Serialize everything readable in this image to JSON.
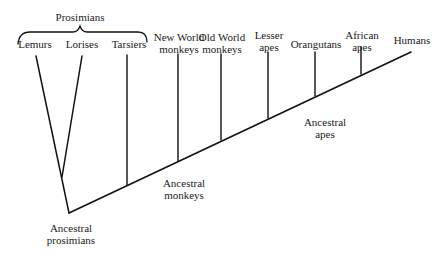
{
  "group_label": "Prosimians",
  "taxa": [
    {
      "id": "lemurs",
      "line1": "Lemurs",
      "line2": ""
    },
    {
      "id": "lorises",
      "line1": "Lorises",
      "line2": ""
    },
    {
      "id": "tarsiers",
      "line1": "Tarsiers",
      "line2": ""
    },
    {
      "id": "new-world-monkeys",
      "line1": "New World",
      "line2": "monkeys"
    },
    {
      "id": "old-world-monkeys",
      "line1": "Old World",
      "line2": "monkeys"
    },
    {
      "id": "lesser-apes",
      "line1": "Lesser",
      "line2": "apes"
    },
    {
      "id": "orangutans",
      "line1": "Orangutans",
      "line2": ""
    },
    {
      "id": "african-apes",
      "line1": "African",
      "line2": "apes"
    },
    {
      "id": "humans",
      "line1": "Humans",
      "line2": ""
    }
  ],
  "ancestors": [
    {
      "id": "ancestral-prosimians",
      "line1": "Ancestral",
      "line2": "prosimians"
    },
    {
      "id": "ancestral-monkeys",
      "line1": "Ancestral",
      "line2": "monkeys"
    },
    {
      "id": "ancestral-apes",
      "line1": "Ancestral",
      "line2": "apes"
    }
  ],
  "colors": {
    "line": "#111111",
    "text": "#1a1a1a",
    "background": "#ffffff"
  }
}
